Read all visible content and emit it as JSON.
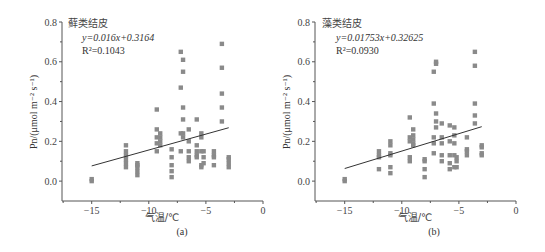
{
  "chart_data": [
    {
      "type": "scatter",
      "panel_label": "(a)",
      "title": "藓类结皮",
      "equation": "y=0.016x+0.3164",
      "r2": "R²=0.1043",
      "xlabel": "气温/℃",
      "ylabel": "Pn/(μmol m⁻² s⁻¹)",
      "xlim": [
        -17.6,
        0
      ],
      "ylim": [
        -0.1,
        0.8
      ],
      "xticks": [
        -15,
        -10,
        -5,
        0
      ],
      "yticks": [
        0.0,
        0.2,
        0.4,
        0.6,
        0.8
      ],
      "ytick_labels": [
        "0.0",
        "0.2",
        "0.4",
        "0.6",
        "0.8"
      ],
      "grid": false,
      "trendline": {
        "slope": 0.016,
        "intercept": 0.3164,
        "x_range": [
          -15,
          -3
        ]
      },
      "points": [
        [
          -15,
          0.0
        ],
        [
          -15,
          0.01
        ],
        [
          -12,
          0.07
        ],
        [
          -12,
          0.09
        ],
        [
          -12,
          0.11
        ],
        [
          -12,
          0.13
        ],
        [
          -12,
          0.15
        ],
        [
          -12,
          0.18
        ],
        [
          -11,
          0.03
        ],
        [
          -11,
          0.05
        ],
        [
          -11,
          0.07
        ],
        [
          -11,
          0.08
        ],
        [
          -11,
          0.09
        ],
        [
          -9.3,
          0.36
        ],
        [
          -9.3,
          0.26
        ],
        [
          -9.3,
          0.22
        ],
        [
          -9.3,
          0.19
        ],
        [
          -9.3,
          0.15
        ],
        [
          -9,
          0.24
        ],
        [
          -9,
          0.22
        ],
        [
          -9,
          0.2
        ],
        [
          -9,
          0.18
        ],
        [
          -8,
          0.02
        ],
        [
          -8,
          0.05
        ],
        [
          -8,
          0.08
        ],
        [
          -8,
          0.12
        ],
        [
          -8,
          0.16
        ],
        [
          -7.2,
          0.65
        ],
        [
          -7.2,
          0.47
        ],
        [
          -7.2,
          0.24
        ],
        [
          -7.2,
          0.15
        ],
        [
          -7,
          0.61
        ],
        [
          -7,
          0.55
        ],
        [
          -7,
          0.37
        ],
        [
          -7,
          0.31
        ],
        [
          -7,
          0.24
        ],
        [
          -7,
          0.22
        ],
        [
          -6.5,
          0.26
        ],
        [
          -6.5,
          0.2
        ],
        [
          -6.5,
          0.15
        ],
        [
          -6.5,
          0.12
        ],
        [
          -6.5,
          0.1
        ],
        [
          -5.8,
          0.31
        ],
        [
          -5.8,
          0.18
        ],
        [
          -5.8,
          0.15
        ],
        [
          -5.8,
          0.13
        ],
        [
          -5.8,
          0.12
        ],
        [
          -5.4,
          0.24
        ],
        [
          -5.4,
          0.22
        ],
        [
          -5.4,
          0.15
        ],
        [
          -5.4,
          0.08
        ],
        [
          -5.4,
          0.07
        ],
        [
          -5.2,
          0.15
        ],
        [
          -5.2,
          0.12
        ],
        [
          -5.2,
          0.09
        ],
        [
          -4.3,
          0.15
        ],
        [
          -4.3,
          0.13
        ],
        [
          -4.3,
          0.12
        ],
        [
          -4.3,
          0.08
        ],
        [
          -3.6,
          0.69
        ],
        [
          -3.6,
          0.57
        ],
        [
          -3.6,
          0.44
        ],
        [
          -3.6,
          0.37
        ],
        [
          -3.6,
          0.3
        ],
        [
          -3,
          0.12
        ],
        [
          -3,
          0.11
        ],
        [
          -3,
          0.09
        ],
        [
          -3,
          0.07
        ]
      ]
    },
    {
      "type": "scatter",
      "panel_label": "(b)",
      "title": "藻类结皮",
      "equation": "y=0.01753x+0.32625",
      "r2": "R²=0.0930",
      "xlabel": "气温/℃",
      "ylabel": "Pn/(μmol m⁻² s⁻¹)",
      "xlim": [
        -17.6,
        0
      ],
      "ylim": [
        -0.1,
        0.8
      ],
      "xticks": [
        -15,
        -10,
        -5,
        0
      ],
      "yticks": [
        0.0,
        0.2,
        0.4,
        0.6,
        0.8
      ],
      "ytick_labels": [
        "0.0",
        "0.2",
        "0.4",
        "0.6",
        "0.8"
      ],
      "grid": false,
      "trendline": {
        "slope": 0.01753,
        "intercept": 0.32625,
        "x_range": [
          -15,
          -3
        ]
      },
      "points": [
        [
          -15,
          0.0
        ],
        [
          -15,
          0.01
        ],
        [
          -12,
          0.06
        ],
        [
          -12,
          0.12
        ],
        [
          -12,
          0.13
        ],
        [
          -12,
          0.15
        ],
        [
          -11,
          0.04
        ],
        [
          -11,
          0.07
        ],
        [
          -11,
          0.13
        ],
        [
          -11,
          0.14
        ],
        [
          -11,
          0.18
        ],
        [
          -11,
          0.2
        ],
        [
          -9.3,
          0.32
        ],
        [
          -9.3,
          0.22
        ],
        [
          -9.3,
          0.2
        ],
        [
          -9.3,
          0.12
        ],
        [
          -9.3,
          0.1
        ],
        [
          -9,
          0.26
        ],
        [
          -9,
          0.23
        ],
        [
          -9,
          0.21
        ],
        [
          -9,
          0.19
        ],
        [
          -9,
          0.18
        ],
        [
          -8,
          0.02
        ],
        [
          -8,
          0.06
        ],
        [
          -8,
          0.1
        ],
        [
          -8,
          0.11
        ],
        [
          -7.2,
          0.55
        ],
        [
          -7.2,
          0.39
        ],
        [
          -7.2,
          0.22
        ],
        [
          -7.2,
          0.19
        ],
        [
          -7.2,
          0.14
        ],
        [
          -7,
          0.6
        ],
        [
          -7,
          0.59
        ],
        [
          -7,
          0.34
        ],
        [
          -7,
          0.3
        ],
        [
          -7,
          0.27
        ],
        [
          -6.5,
          0.29
        ],
        [
          -6.5,
          0.22
        ],
        [
          -6.5,
          0.19
        ],
        [
          -6.5,
          0.13
        ],
        [
          -6.5,
          0.1
        ],
        [
          -5.8,
          0.28
        ],
        [
          -5.8,
          0.2
        ],
        [
          -5.8,
          0.13
        ],
        [
          -5.8,
          0.09
        ],
        [
          -5.8,
          0.06
        ],
        [
          -5.4,
          0.27
        ],
        [
          -5.4,
          0.23
        ],
        [
          -5.4,
          0.19
        ],
        [
          -5.4,
          0.13
        ],
        [
          -5.4,
          0.07
        ],
        [
          -5.2,
          0.12
        ],
        [
          -5.2,
          0.1
        ],
        [
          -5.2,
          0.07
        ],
        [
          -4.3,
          0.22
        ],
        [
          -4.3,
          0.16
        ],
        [
          -4.3,
          0.15
        ],
        [
          -4.3,
          0.13
        ],
        [
          -3.6,
          0.65
        ],
        [
          -3.6,
          0.58
        ],
        [
          -3.6,
          0.39
        ],
        [
          -3.6,
          0.33
        ],
        [
          -3.6,
          0.29
        ],
        [
          -3,
          0.18
        ],
        [
          -3,
          0.17
        ],
        [
          -3,
          0.14
        ],
        [
          -3,
          0.13
        ]
      ]
    }
  ],
  "style": {
    "axis_color": "#555555",
    "point_color": "#8a8a8a",
    "line_color": "#333333"
  }
}
